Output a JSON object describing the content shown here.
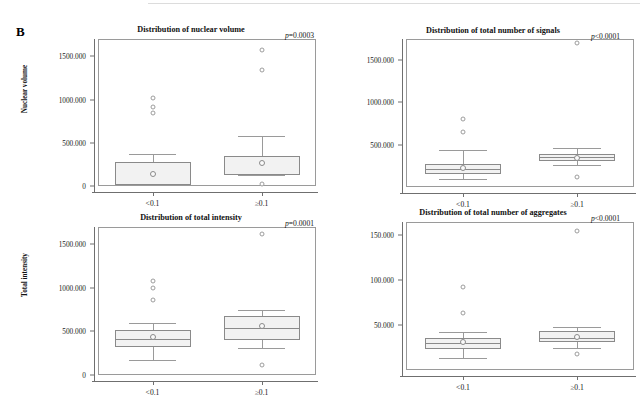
{
  "figure": {
    "panel_letter": "B"
  },
  "chart_data": [
    {
      "id": "nuclear-volume",
      "type": "box",
      "title": "Distribution of nuclear volume",
      "ylabel": "Nuclear volume",
      "xlabel": "",
      "annotation": "p=0.0003",
      "annotation_italic_prefix": "p",
      "annotation_rest": "=0.0003",
      "ylim": [
        0,
        1700000
      ],
      "yticks": [
        0,
        500000,
        1000000,
        1500000
      ],
      "ytick_labels": [
        "0",
        "500.000",
        "1000.000",
        "1500.000"
      ],
      "categories": [
        "<0.1",
        "≥0.1"
      ],
      "grid": false,
      "boxes": [
        {
          "category": "<0.1",
          "whisker_low": 10000,
          "q1": 15000,
          "median": 278000,
          "q3": 280000,
          "whisker_high": 372000,
          "mean": 135000,
          "outliers": [
            1020000,
            912000,
            840000
          ]
        },
        {
          "category": "≥0.1",
          "whisker_low": 122000,
          "q1": 125000,
          "median": 350000,
          "q3": 352000,
          "whisker_high": 578000,
          "mean": 268000,
          "outliers": [
            1570000,
            1340000,
            22000
          ]
        }
      ]
    },
    {
      "id": "total-number-of-signals",
      "type": "box",
      "title": "Distribution of total number of signals",
      "ylabel": "",
      "xlabel": "",
      "annotation": "p<0.0001",
      "annotation_italic_prefix": "p",
      "annotation_rest": "<0.0001",
      "ylim": [
        0,
        1750000
      ],
      "yticks": [
        500000,
        1000000,
        1500000
      ],
      "ytick_labels": [
        "500.000",
        "1000.000",
        "1500.000"
      ],
      "categories": [
        "<0.1",
        "≥0.1"
      ],
      "grid": false,
      "boxes": [
        {
          "category": "<0.1",
          "whisker_low": 90000,
          "q1": 150000,
          "median": 215000,
          "q3": 270000,
          "whisker_high": 440000,
          "mean": 222000,
          "outliers": [
            800000,
            650000
          ]
        },
        {
          "category": "≥0.1",
          "whisker_low": 255000,
          "q1": 305000,
          "median": 350000,
          "q3": 385000,
          "whisker_high": 465000,
          "mean": 345000,
          "outliers": [
            1700000,
            115000
          ]
        }
      ]
    },
    {
      "id": "total-intensity",
      "type": "box",
      "title": "Distribution of total intensity",
      "ylabel": "Total intensity",
      "xlabel": "",
      "annotation": "p=0.0001",
      "annotation_italic_prefix": "p",
      "annotation_rest": "=0.0001",
      "ylim": [
        0,
        1700000
      ],
      "yticks": [
        0,
        500000,
        1000000,
        1500000
      ],
      "ytick_labels": [
        "0",
        "500.000",
        "1000.000",
        "1500.000"
      ],
      "categories": [
        "<0.1",
        "≥0.1"
      ],
      "grid": false,
      "boxes": [
        {
          "category": "<0.1",
          "whisker_low": 175000,
          "q1": 325000,
          "median": 410000,
          "q3": 515000,
          "whisker_high": 600000,
          "mean": 432000,
          "outliers": [
            1085000,
            1000000,
            865000
          ]
        },
        {
          "category": "≥0.1",
          "whisker_low": 310000,
          "q1": 405000,
          "median": 535000,
          "q3": 672000,
          "whisker_high": 750000,
          "mean": 565000,
          "outliers": [
            1615000,
            110000
          ]
        }
      ]
    },
    {
      "id": "total-number-of-aggregates",
      "type": "box",
      "title": "Distribution of total number of aggregates",
      "ylabel": "",
      "xlabel": "",
      "annotation": "p<0.0001",
      "annotation_italic_prefix": "p",
      "annotation_rest": "<0.0001",
      "ylim": [
        0,
        165000
      ],
      "yticks": [
        50000,
        100000,
        150000
      ],
      "ytick_labels": [
        "50.000",
        "100.000",
        "150.000"
      ],
      "categories": [
        "<0.1",
        "≥0.1"
      ],
      "grid": false,
      "boxes": [
        {
          "category": "<0.1",
          "whisker_low": 13000,
          "q1": 23000,
          "median": 30000,
          "q3": 36000,
          "whisker_high": 42000,
          "mean": 31000,
          "outliers": [
            92000,
            64000
          ]
        },
        {
          "category": "≥0.1",
          "whisker_low": 25000,
          "q1": 31000,
          "median": 36000,
          "q3": 43000,
          "whisker_high": 48000,
          "mean": 36500,
          "outliers": [
            155000,
            18000
          ]
        }
      ]
    }
  ]
}
